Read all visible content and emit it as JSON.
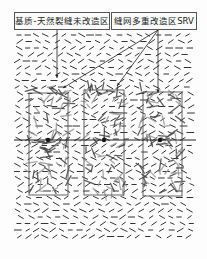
{
  "labels": {
    "matrix_zone": "基质-天然裂缝未改造区",
    "srv_zone": "缝网多重改造区SRV"
  },
  "colors": {
    "background": "#fdfdfd",
    "natural_fracture": "#333333",
    "srv_fracture_dark": "#444444",
    "srv_fracture_light": "#9a9a9a",
    "frame": "#555555",
    "wellbore": "#222222"
  },
  "layout": {
    "fracture_field": {
      "x0": 17,
      "y0": 32,
      "x1": 192,
      "y1": 240
    },
    "wellbore_y": 140,
    "wellbore_x": [
      14,
      196
    ],
    "srv_boxes": [
      {
        "x": 29,
        "y": 93,
        "w": 39,
        "h": 102,
        "cx": 48
      },
      {
        "x": 84,
        "y": 90,
        "w": 40,
        "h": 105,
        "cx": 104
      },
      {
        "x": 143,
        "y": 92,
        "w": 39,
        "h": 104,
        "cx": 160
      }
    ],
    "leaders": [
      {
        "from": [
          57,
          30
        ],
        "to": [
          57,
          78
        ]
      },
      {
        "from": [
          158,
          30
        ],
        "to": [
          63,
          88
        ]
      },
      {
        "from": [
          158,
          30
        ],
        "to": [
          117,
          86
        ]
      },
      {
        "from": [
          158,
          30
        ],
        "to": [
          158,
          93
        ]
      }
    ]
  }
}
